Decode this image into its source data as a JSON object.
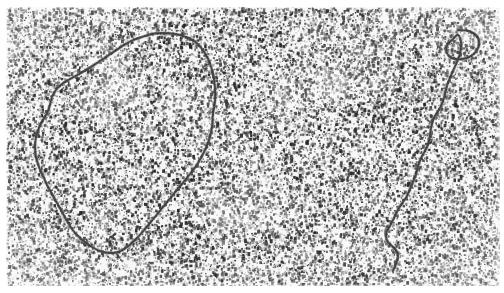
{
  "image": {
    "kind": "electron-micrograph",
    "subject": "DNA molecules visualized by transmission electron microscopy",
    "width": 504,
    "height": 293,
    "background_color": "#ffffff",
    "field_color": "#f7f7f7",
    "grain_color": "#2e2e2e",
    "filament_color": "#4e4e4e",
    "filament_halo_color": "#8d8d8d",
    "caption": "",
    "labels": [],
    "scale_bar": null
  },
  "field": {
    "x": 6,
    "y": 7,
    "width": 494,
    "height": 279,
    "grain": {
      "dot_count": 26000,
      "min_size": 1,
      "max_size": 3,
      "min_opacity": 0.12,
      "max_opacity": 0.95,
      "seed": 20240517
    }
  },
  "molecules": [
    {
      "id": "circular-dna",
      "name": "circular-dna-molecule",
      "topology": "closed circular",
      "closed": true,
      "bounds": {
        "x": 34,
        "y": 30,
        "width": 184,
        "height": 226
      },
      "points": [
        [
          163,
          33
        ],
        [
          180,
          35
        ],
        [
          194,
          41
        ],
        [
          203,
          50
        ],
        [
          209,
          61
        ],
        [
          213,
          74
        ],
        [
          215,
          88
        ],
        [
          215,
          101
        ],
        [
          213,
          114
        ],
        [
          212,
          127
        ],
        [
          209,
          140
        ],
        [
          204,
          152
        ],
        [
          198,
          163
        ],
        [
          190,
          174
        ],
        [
          181,
          185
        ],
        [
          172,
          196
        ],
        [
          163,
          207
        ],
        [
          154,
          218
        ],
        [
          145,
          229
        ],
        [
          136,
          239
        ],
        [
          127,
          247
        ],
        [
          118,
          252
        ],
        [
          109,
          253
        ],
        [
          100,
          251
        ],
        [
          92,
          247
        ],
        [
          85,
          242
        ],
        [
          78,
          236
        ],
        [
          72,
          229
        ],
        [
          67,
          221
        ],
        [
          62,
          212
        ],
        [
          57,
          203
        ],
        [
          52,
          194
        ],
        [
          47,
          185
        ],
        [
          43,
          176
        ],
        [
          39,
          167
        ],
        [
          36,
          157
        ],
        [
          35,
          147
        ],
        [
          36,
          137
        ],
        [
          39,
          128
        ],
        [
          43,
          120
        ],
        [
          47,
          113
        ],
        [
          50,
          105
        ],
        [
          52,
          97
        ],
        [
          56,
          90
        ],
        [
          62,
          84
        ],
        [
          70,
          79
        ],
        [
          79,
          74
        ],
        [
          88,
          69
        ],
        [
          97,
          63
        ],
        [
          106,
          57
        ],
        [
          115,
          51
        ],
        [
          124,
          45
        ],
        [
          133,
          40
        ],
        [
          142,
          37
        ],
        [
          152,
          34
        ]
      ]
    },
    {
      "id": "linear-dna",
      "name": "linear-dna-molecule",
      "topology": "linear strand with terminal loop",
      "closed": false,
      "bounds": {
        "x": 385,
        "y": 29,
        "width": 95,
        "height": 244
      },
      "points": [
        [
          458,
          30
        ],
        [
          468,
          31
        ],
        [
          476,
          35
        ],
        [
          479,
          42
        ],
        [
          477,
          50
        ],
        [
          471,
          56
        ],
        [
          463,
          59
        ],
        [
          455,
          59
        ],
        [
          449,
          56
        ],
        [
          446,
          50
        ],
        [
          448,
          44
        ],
        [
          453,
          39
        ],
        [
          458,
          35
        ],
        [
          461,
          43
        ],
        [
          460,
          53
        ],
        [
          457,
          62
        ],
        [
          453,
          71
        ],
        [
          449,
          80
        ],
        [
          446,
          89
        ],
        [
          444,
          98
        ],
        [
          441,
          106
        ],
        [
          437,
          113
        ],
        [
          433,
          120
        ],
        [
          431,
          128
        ],
        [
          430,
          136
        ],
        [
          428,
          144
        ],
        [
          425,
          151
        ],
        [
          421,
          158
        ],
        [
          418,
          166
        ],
        [
          416,
          174
        ],
        [
          413,
          182
        ],
        [
          410,
          189
        ],
        [
          407,
          196
        ],
        [
          403,
          202
        ],
        [
          399,
          208
        ],
        [
          396,
          214
        ],
        [
          393,
          220
        ],
        [
          390,
          226
        ],
        [
          387,
          231
        ],
        [
          386,
          237
        ],
        [
          388,
          242
        ],
        [
          392,
          246
        ],
        [
          396,
          250
        ],
        [
          398,
          255
        ],
        [
          397,
          261
        ],
        [
          395,
          266
        ],
        [
          393,
          271
        ]
      ]
    }
  ]
}
